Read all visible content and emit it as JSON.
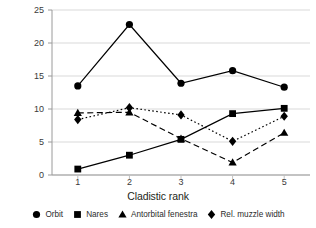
{
  "chart_data": {
    "type": "line",
    "title": "",
    "xlabel": "Cladistic rank",
    "ylabel": "Lateral area of skull openings (%)",
    "x": [
      1,
      2,
      3,
      4,
      5
    ],
    "categories": [
      "1",
      "2",
      "3",
      "4",
      "5"
    ],
    "xtick_labels": [
      "1",
      "2",
      "3",
      "4",
      "5"
    ],
    "ytick_labels": [
      "0",
      "5",
      "10",
      "15",
      "20",
      "25"
    ],
    "ytick_values": [
      0,
      5,
      10,
      15,
      20,
      25
    ],
    "ylim": [
      0,
      25
    ],
    "xlim": [
      0.5,
      5.5
    ],
    "grid": "horizontal",
    "legend_position": "bottom",
    "series": [
      {
        "name": "Orbit",
        "marker": "circle",
        "line_style": "solid",
        "color": "#000000",
        "values": [
          13.5,
          22.8,
          13.9,
          15.8,
          13.3
        ]
      },
      {
        "name": "Nares",
        "marker": "square",
        "line_style": "solid",
        "color": "#000000",
        "values": [
          0.9,
          3.0,
          5.4,
          9.3,
          10.1
        ]
      },
      {
        "name": "Antorbital fenestra",
        "marker": "triangle",
        "line_style": "dashed",
        "color": "#000000",
        "values": [
          9.4,
          9.5,
          5.5,
          1.9,
          6.4
        ]
      },
      {
        "name": "Rel. muzzle width",
        "marker": "diamond",
        "line_style": "dotted",
        "color": "#000000",
        "values": [
          8.4,
          10.2,
          9.1,
          5.1,
          8.9
        ]
      }
    ]
  },
  "axis": {
    "y_label": "Lateral area of skull openings (%)",
    "x_label": "Cladistic rank",
    "y_ticks": [
      "0",
      "5",
      "10",
      "15",
      "20",
      "25"
    ],
    "x_ticks": [
      "1",
      "2",
      "3",
      "4",
      "5"
    ]
  },
  "legend": {
    "items": [
      {
        "label": "Orbit",
        "marker": "circle"
      },
      {
        "label": "Nares",
        "marker": "square"
      },
      {
        "label": "Antorbital fenestra",
        "marker": "triangle"
      },
      {
        "label": "Rel. muzzle width",
        "marker": "diamond"
      }
    ]
  }
}
